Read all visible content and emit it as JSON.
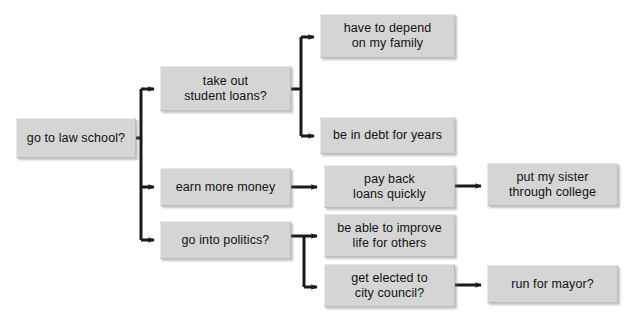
{
  "diagram": {
    "type": "flowchart",
    "background_color": "#ffffff",
    "node_fill_color": "#d5d5d5",
    "node_border_color": "#bdbdbd",
    "connector_color": "#1a1a1a",
    "text_color": "#111111",
    "nodes": [
      {
        "id": "law-school",
        "label": "go to law school?",
        "x": 16,
        "y": 118,
        "w": 120,
        "h": 40,
        "level": 0
      },
      {
        "id": "student-loans",
        "label": "take out\nstudent loans?",
        "x": 160,
        "y": 66,
        "w": 131,
        "h": 45,
        "level": 1
      },
      {
        "id": "earn-money",
        "label": "earn more money",
        "x": 160,
        "y": 168,
        "w": 131,
        "h": 38,
        "level": 1
      },
      {
        "id": "politics",
        "label": "go into politics?",
        "x": 160,
        "y": 221,
        "w": 131,
        "h": 38,
        "level": 1
      },
      {
        "id": "depend-family",
        "label": "have to depend\non my family",
        "x": 320,
        "y": 14,
        "w": 135,
        "h": 44,
        "level": 2
      },
      {
        "id": "in-debt",
        "label": "be in debt for years",
        "x": 320,
        "y": 117,
        "w": 135,
        "h": 37,
        "level": 2
      },
      {
        "id": "pay-back",
        "label": "pay back\nloans quickly",
        "x": 324,
        "y": 165,
        "w": 131,
        "h": 43,
        "level": 2
      },
      {
        "id": "improve-life",
        "label": "be able to improve\nlife for others",
        "x": 324,
        "y": 214,
        "w": 131,
        "h": 43,
        "level": 2
      },
      {
        "id": "city-council",
        "label": "get elected to\ncity council?",
        "x": 324,
        "y": 264,
        "w": 131,
        "h": 43,
        "level": 2
      },
      {
        "id": "sister-college",
        "label": "put my sister\nthrough college",
        "x": 487,
        "y": 163,
        "w": 131,
        "h": 43,
        "level": 3
      },
      {
        "id": "run-mayor",
        "label": "run for mayor?",
        "x": 487,
        "y": 265,
        "w": 131,
        "h": 38,
        "level": 3
      }
    ],
    "edges": [
      {
        "id": "e1",
        "from": "law-school",
        "to": "student-loans",
        "style": "elbow-up"
      },
      {
        "id": "e2",
        "from": "law-school",
        "to": "earn-money",
        "style": "elbow-down"
      },
      {
        "id": "e3",
        "from": "law-school",
        "to": "politics",
        "style": "elbow-down"
      },
      {
        "id": "e4",
        "from": "student-loans",
        "to": "depend-family",
        "style": "elbow-up"
      },
      {
        "id": "e5",
        "from": "student-loans",
        "to": "in-debt",
        "style": "elbow-down"
      },
      {
        "id": "e6",
        "from": "earn-money",
        "to": "pay-back",
        "style": "straight"
      },
      {
        "id": "e7",
        "from": "politics",
        "to": "improve-life",
        "style": "elbow-up"
      },
      {
        "id": "e8",
        "from": "politics",
        "to": "city-council",
        "style": "elbow-down"
      },
      {
        "id": "e9",
        "from": "pay-back",
        "to": "sister-college",
        "style": "straight"
      },
      {
        "id": "e10",
        "from": "city-council",
        "to": "run-mayor",
        "style": "straight"
      }
    ]
  }
}
